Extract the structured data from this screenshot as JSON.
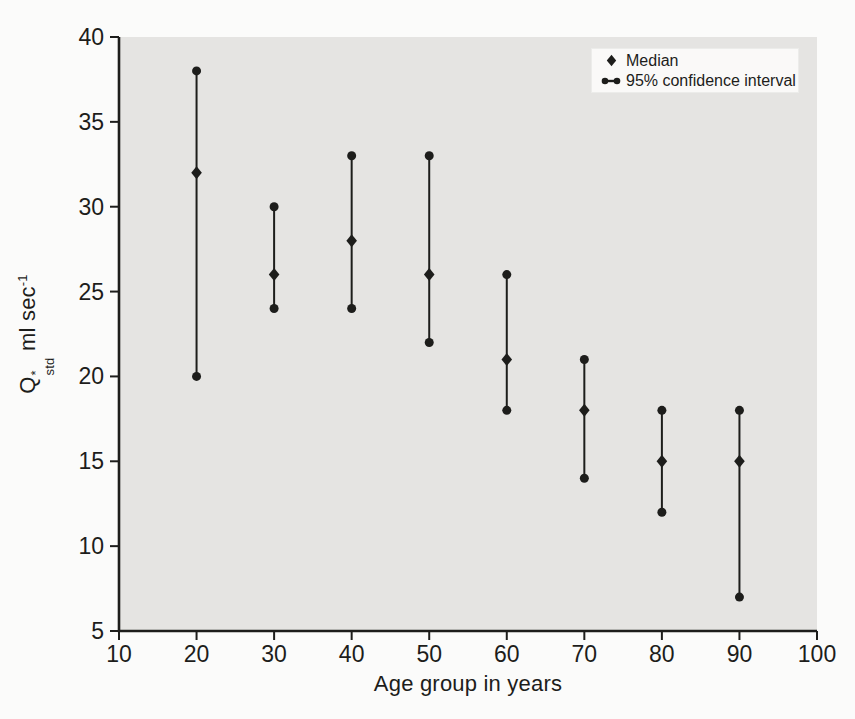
{
  "figure": {
    "page_bg": "#fbfbfa",
    "plot_bg": "#e5e4e2",
    "ink": "#1d1d1b",
    "legend_bg": "#faf9f8",
    "legend_border": "#ececea"
  },
  "chart_data": {
    "type": "scatter",
    "subtype": "median-with-95-percent-confidence-interval-error-bars",
    "title": "",
    "xlabel": "Age group in years",
    "ylabel": "Q*std ml sec-1",
    "ylabel_parts": {
      "base": "Q",
      "sup": "*",
      "sub": "std",
      "unit": "ml sec",
      "exp": "-1"
    },
    "xlim": [
      10,
      100
    ],
    "ylim": [
      5,
      40
    ],
    "x_ticks": [
      10,
      20,
      30,
      40,
      50,
      60,
      70,
      80,
      90,
      100
    ],
    "y_ticks": [
      5,
      10,
      15,
      20,
      25,
      30,
      35,
      40
    ],
    "grid": false,
    "legend_position": "top-right-inside",
    "categories": [
      20,
      30,
      40,
      50,
      60,
      70,
      80,
      90
    ],
    "series": [
      {
        "name": "Median",
        "marker": "diamond",
        "values": [
          32,
          26,
          28,
          26,
          21,
          18,
          15,
          15
        ]
      },
      {
        "name": "95% confidence interval",
        "marker": "dot-capped-vertical-bar",
        "low": [
          20,
          24,
          24,
          22,
          18,
          14,
          12,
          7
        ],
        "high": [
          38,
          30,
          33,
          33,
          26,
          21,
          18,
          18
        ]
      }
    ]
  },
  "legend": {
    "items": [
      {
        "label": "Median"
      },
      {
        "label": "95% confidence interval"
      }
    ]
  }
}
